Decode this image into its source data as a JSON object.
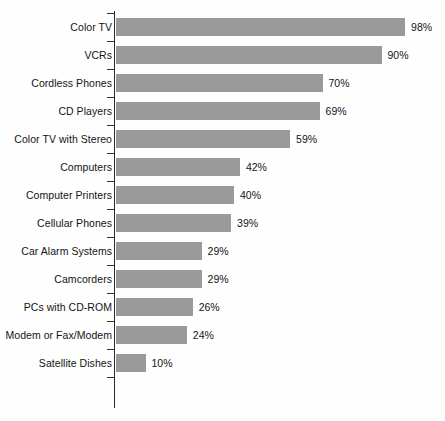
{
  "chart_data": {
    "type": "bar",
    "orientation": "horizontal",
    "title": "",
    "subtitle": "",
    "xlabel": "",
    "ylabel": "",
    "xlim": [
      0,
      100
    ],
    "grid": false,
    "legend": null,
    "value_suffix": "%",
    "categories": [
      "Color TV",
      "VCRs",
      "Cordless Phones",
      "CD Players",
      "Color TV with Stereo",
      "Computers",
      "Computer Printers",
      "Cellular Phones",
      "Car Alarm Systems",
      "Camcorders",
      "PCs with CD-ROM",
      "Modem or Fax/Modem",
      "Satellite Dishes"
    ],
    "values": [
      98,
      90,
      70,
      69,
      59,
      42,
      40,
      39,
      29,
      29,
      26,
      24,
      10
    ],
    "value_labels": [
      "98%",
      "90%",
      "70%",
      "69%",
      "59%",
      "42%",
      "40%",
      "39%",
      "29%",
      "29%",
      "26%",
      "24%",
      "10%"
    ],
    "bar_color": "#9a9a9a",
    "axis_color": "#2b2b2b",
    "text_color": "#141414",
    "background_color": "#fefefe"
  }
}
